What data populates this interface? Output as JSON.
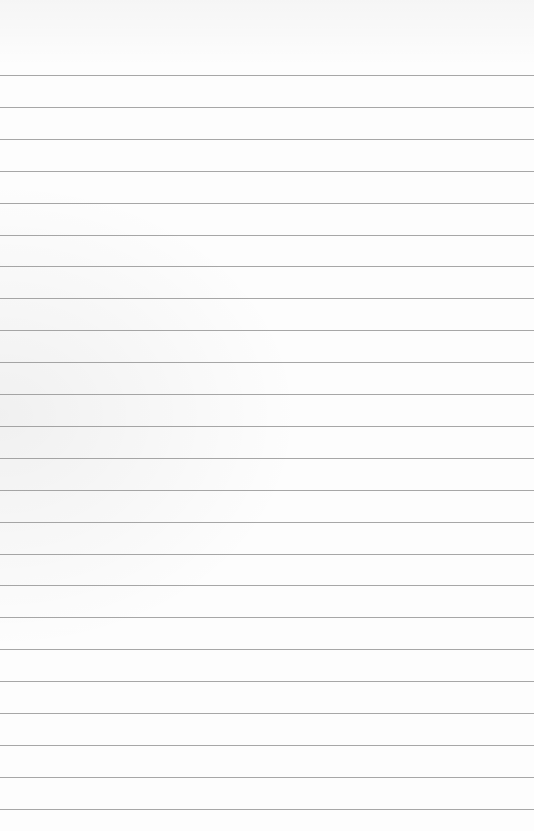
{
  "page": {
    "type": "lined-paper",
    "rule_count": 24,
    "background_color": "#fdfdfd",
    "rule_color": "#8a8a8a",
    "text_content": []
  }
}
